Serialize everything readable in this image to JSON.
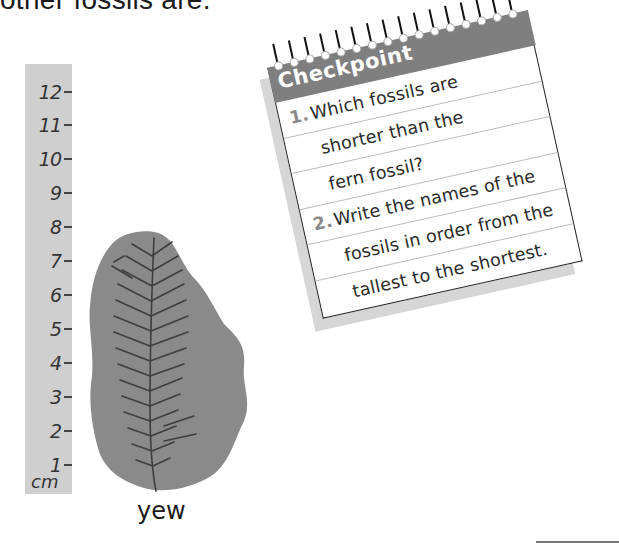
{
  "page": {
    "top_text": "other fossils are."
  },
  "ruler": {
    "unit": "cm",
    "ticks": [
      "12",
      "11",
      "10",
      "9",
      "8",
      "7",
      "6",
      "5",
      "4",
      "3",
      "2",
      "1"
    ],
    "color": "#cfcfcf"
  },
  "fossil": {
    "name": "yew",
    "icon": "yew-fossil-image"
  },
  "checkpoint": {
    "title": "Checkpoint",
    "ring_count": 16,
    "header_color": "#7f7f7f",
    "questions": [
      {
        "number": "1.",
        "lines": [
          "Which fossils are",
          "shorter than the",
          "fern fossil?"
        ]
      },
      {
        "number": "2.",
        "lines": [
          "Write the names of the",
          "fossils in order from the",
          "tallest to the shortest."
        ]
      }
    ]
  }
}
